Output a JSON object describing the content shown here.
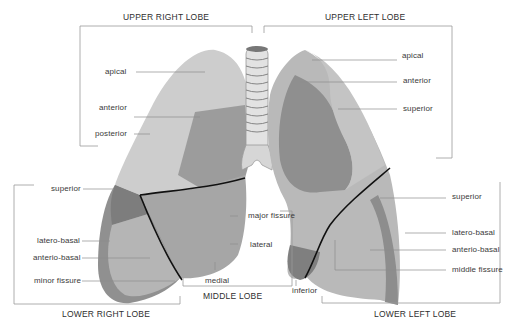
{
  "diagram": {
    "colors": {
      "lung_light": "#c9c9c9",
      "lung_mid": "#a8a8a8",
      "lung_dark": "#8a8a8a",
      "fissure": "#111111",
      "leader_line": "#8c8c8c",
      "bracket": "#9a9a9a",
      "text": "#3a3a3a"
    },
    "lobes": {
      "upper_right": "UPPER RIGHT LOBE",
      "upper_left": "UPPER LEFT LOBE",
      "middle": "MIDDLE LOBE",
      "lower_right": "LOWER RIGHT LOBE",
      "lower_left": "LOWER LEFT LOBE"
    },
    "labels": {
      "upper_right": [
        "apical",
        "anterior",
        "posterior"
      ],
      "upper_left": [
        "apical",
        "anterior",
        "superior"
      ],
      "middle": [
        "major fissure",
        "lateral",
        "medial",
        "inferior"
      ],
      "lower_right": [
        "superior",
        "latero-basal",
        "anterio-basal",
        "minor fissure"
      ],
      "lower_left": [
        "superior",
        "latero-basal",
        "anterio-basal",
        "middle fissure"
      ]
    }
  }
}
